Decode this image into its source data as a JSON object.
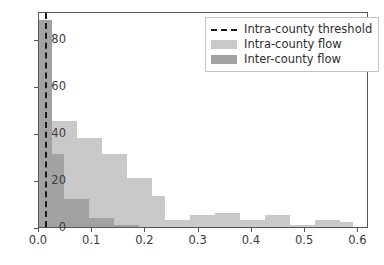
{
  "chart_data": {
    "type": "bar",
    "title": "",
    "subtitle": "",
    "xlabel": "",
    "ylabel": "",
    "xlim": [
      0.0,
      0.62
    ],
    "ylim": [
      0,
      92
    ],
    "grid": false,
    "legend_position": "upper right",
    "bin_width": 0.0236,
    "xticks": [
      0.0,
      0.1,
      0.2,
      0.3,
      0.4,
      0.5,
      0.6
    ],
    "xtick_labels": [
      "0.0",
      "0.1",
      "0.2",
      "0.3",
      "0.4",
      "0.5",
      "0.6"
    ],
    "yticks": [
      0,
      20,
      40,
      60,
      80
    ],
    "ytick_labels": [
      "0",
      "20",
      "40",
      "60",
      "80"
    ],
    "annotations": [
      {
        "name": "intra-county-threshold",
        "type": "vline",
        "x": 0.012,
        "style": "dashed",
        "color": "#1a1a1a",
        "label": "Intra-county threshold"
      }
    ],
    "series": [
      {
        "name": "Intra-county flow",
        "color": "#c9c9c9",
        "bin_edges": [
          0.0,
          0.0236,
          0.0472,
          0.0708,
          0.0944,
          0.118,
          0.1416,
          0.1652,
          0.1888,
          0.2124,
          0.236,
          0.2596,
          0.2832,
          0.3068,
          0.3304,
          0.354,
          0.3776,
          0.4012,
          0.4248,
          0.4484,
          0.472,
          0.4956,
          0.5192,
          0.5428,
          0.5664,
          0.59
        ],
        "values": [
          88,
          45,
          45,
          38,
          38,
          31,
          31,
          21,
          21,
          13,
          3,
          3,
          5,
          5,
          6,
          6,
          3,
          3,
          5,
          5,
          1,
          1,
          3,
          3,
          2
        ]
      },
      {
        "name": "Inter-county flow",
        "color": "#a2a2a2",
        "bin_edges": [
          0.0,
          0.0236,
          0.0472,
          0.0708,
          0.0944,
          0.118,
          0.1416,
          0.1652,
          0.1888,
          0.2124,
          0.236
        ],
        "values": [
          88,
          31,
          12,
          12,
          4,
          4,
          1,
          1,
          0,
          0
        ]
      }
    ]
  },
  "legend": {
    "entries": [
      {
        "label": "Intra-county threshold",
        "key": "dashed-line",
        "color": "#1a1a1a"
      },
      {
        "label": "Intra-county flow",
        "key": "swatch",
        "color": "#c9c9c9"
      },
      {
        "label": "Inter-county flow",
        "key": "swatch",
        "color": "#a2a2a2"
      }
    ]
  }
}
